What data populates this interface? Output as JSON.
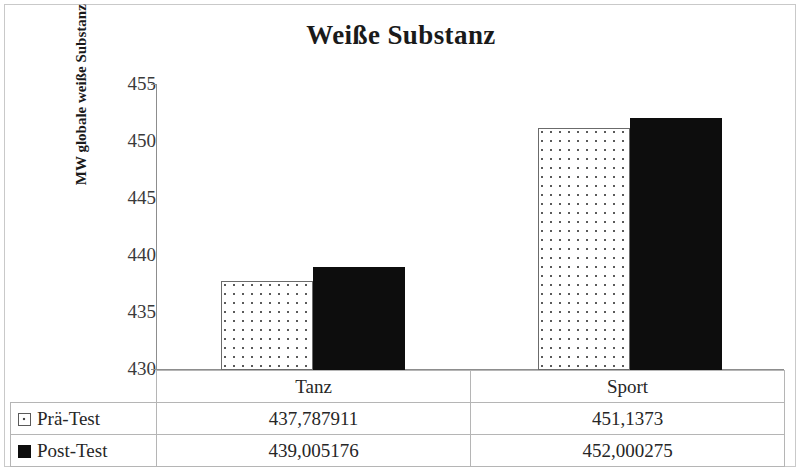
{
  "chart_data": {
    "type": "bar",
    "title": "Weiße Substanz",
    "xlabel": "",
    "ylabel": "MW globale weiße Substanz [cm³]",
    "ylabel_main": "MW globale weiße Substanz [cm",
    "ylabel_sup": "3",
    "ylabel_tail": "]",
    "categories": [
      "Tanz",
      "Sport"
    ],
    "series": [
      {
        "name": "Prä-Test",
        "marker": "dotted-square",
        "values": [
          437.787911,
          451.1373
        ],
        "value_labels": [
          "437,787911",
          "451,1373"
        ]
      },
      {
        "name": "Post-Test",
        "marker": "solid-black-square",
        "values": [
          439.005176,
          452.000275
        ],
        "value_labels": [
          "439,005176",
          "452,000275"
        ]
      }
    ],
    "ylim": [
      430,
      455
    ],
    "yticks": [
      455,
      450,
      445,
      440,
      435,
      430
    ],
    "ytick_labels": [
      "455",
      "450",
      "445",
      "440",
      "435",
      "430"
    ],
    "grid": false,
    "legend_position": "bottom-table",
    "colors": {
      "series_1_fill": "#ffffff",
      "series_1_pattern": "#5a5a5a",
      "series_1_border": "#6b6b6b",
      "series_2_fill": "#0d0d0d",
      "axis": "#8d8d8d",
      "table_border": "#b5b5b5",
      "text": "#262626"
    }
  },
  "table": {
    "category_header_empty": "",
    "categories": [
      "Tanz",
      "Sport"
    ],
    "rows": [
      {
        "label": "Prä-Test",
        "values": [
          "437,787911",
          "451,1373"
        ]
      },
      {
        "label": "Post-Test",
        "values": [
          "439,005176",
          "452,000275"
        ]
      }
    ]
  }
}
